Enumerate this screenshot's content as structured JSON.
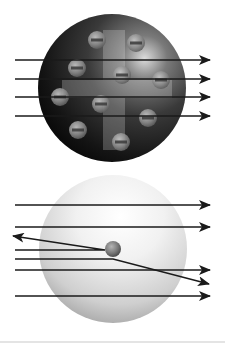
{
  "figure": {
    "colors": {
      "background": "#ffffff",
      "arrow": "#1a1a1a",
      "top_sphere_dark": "#0a0a0a",
      "top_sphere_highlight": "#d8d8d8",
      "bottom_sphere_light": "#fafafa",
      "bottom_sphere_shadow": "#9a9a9a",
      "electron": "#8a8a8a",
      "electron_bar": "#3a3a3a",
      "nucleus": "#6e6e6e"
    },
    "top_model": {
      "name": "plum-pudding-model",
      "sphere": {
        "cx": 112,
        "cy": 88,
        "r": 74
      },
      "plus_sign": {
        "h": [
          62,
          80,
          110,
          18
        ],
        "v": [
          103,
          30,
          22,
          120
        ]
      },
      "electrons": [
        {
          "cx": 97,
          "cy": 40
        },
        {
          "cx": 136,
          "cy": 43
        },
        {
          "cx": 77,
          "cy": 68
        },
        {
          "cx": 122,
          "cy": 75
        },
        {
          "cx": 161,
          "cy": 80
        },
        {
          "cx": 60,
          "cy": 97
        },
        {
          "cx": 101,
          "cy": 104
        },
        {
          "cx": 148,
          "cy": 118
        },
        {
          "cx": 78,
          "cy": 130
        },
        {
          "cx": 121,
          "cy": 142
        }
      ],
      "electron_r": 9,
      "rays": [
        {
          "y": 60
        },
        {
          "y": 79
        },
        {
          "y": 97
        },
        {
          "y": 116
        }
      ],
      "ray_x_start": 15,
      "ray_x_end": 210
    },
    "bottom_model": {
      "name": "nuclear-model",
      "sphere": {
        "cx": 113,
        "cy": 249,
        "r": 74
      },
      "nucleus": {
        "cx": 113,
        "cy": 249,
        "r": 8
      },
      "straight_rays": [
        {
          "y": 205
        },
        {
          "y": 227
        },
        {
          "y": 270
        },
        {
          "y": 296
        }
      ],
      "reflected_ray": {
        "in_y": 250,
        "hit_x": 105,
        "out_x": 13,
        "out_y": 236
      },
      "deflected_ray": {
        "in_y": 259,
        "hit_x": 113,
        "out_x": 209,
        "out_y": 284
      },
      "ray_x_start": 15,
      "ray_x_end": 210
    }
  }
}
